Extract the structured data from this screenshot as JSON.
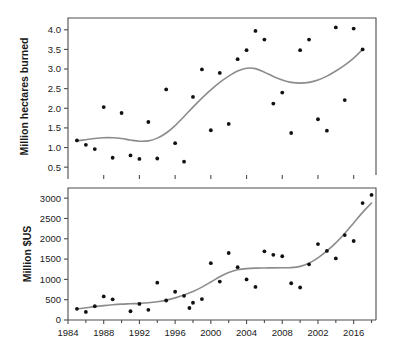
{
  "figure": {
    "type": "two-panel-scatter-with-smoother",
    "background": "#ffffff",
    "point_color": "#111111",
    "smoother_color": "#8c8c8c"
  },
  "chart_data": [
    {
      "type": "scatter",
      "panel": "top",
      "title": "",
      "xlabel": "",
      "ylabel": "Million hectares burned",
      "xlim": [
        1984,
        2018.5
      ],
      "ylim": [
        0.3,
        4.3
      ],
      "grid": false,
      "legend": "none",
      "xticks": [
        1984,
        1988,
        1992,
        1996,
        2000,
        2004,
        2008,
        2012,
        2016
      ],
      "xticklabels": [
        "",
        "",
        "",
        "",
        "",
        "",
        "",
        "",
        ""
      ],
      "yticks": [
        0.5,
        1.0,
        1.5,
        2.0,
        2.5,
        3.0,
        3.5,
        4.0
      ],
      "yticklabels": [
        "0.5",
        "1.0",
        "1.5",
        "2.0",
        "2.5",
        "3.0",
        "3.5",
        "4.0"
      ],
      "x": [
        1985,
        1986,
        1987,
        1988,
        1989,
        1990,
        1991,
        1992,
        1993,
        1994,
        1995,
        1996,
        1997,
        1998,
        1999,
        2000,
        2001,
        2002,
        2003,
        2004,
        2005,
        2006,
        2007,
        2008,
        2009,
        2010,
        2011,
        2012,
        2013,
        2014,
        2015,
        2016,
        2017,
        2018
      ],
      "y": [
        1.18,
        1.07,
        0.96,
        2.03,
        0.74,
        1.88,
        0.8,
        0.71,
        1.65,
        0.72,
        2.48,
        1.11,
        0.64,
        2.29,
        2.99,
        1.44,
        2.9,
        1.6,
        3.25,
        3.48,
        3.97,
        3.75,
        2.12,
        2.4,
        1.37,
        3.48,
        3.75,
        1.72,
        1.43,
        4.06,
        2.21,
        4.03,
        3.5
      ],
      "series": [
        {
          "name": "Annual burned area",
          "points": [
            {
              "x": 1985,
              "y": 1.18
            },
            {
              "x": 1986,
              "y": 1.07
            },
            {
              "x": 1987,
              "y": 0.96
            },
            {
              "x": 1988,
              "y": 2.03
            },
            {
              "x": 1989,
              "y": 0.74
            },
            {
              "x": 1990,
              "y": 1.88
            },
            {
              "x": 1991,
              "y": 0.8
            },
            {
              "x": 1992,
              "y": 0.71
            },
            {
              "x": 1993,
              "y": 1.65
            },
            {
              "x": 1994,
              "y": 0.72
            },
            {
              "x": 1995,
              "y": 2.48
            },
            {
              "x": 1996,
              "y": 1.11
            },
            {
              "x": 1997,
              "y": 0.64
            },
            {
              "x": 1998,
              "y": 2.29
            },
            {
              "x": 1999,
              "y": 2.99
            },
            {
              "x": 2000,
              "y": 1.44
            },
            {
              "x": 2001,
              "y": 2.9
            },
            {
              "x": 2002,
              "y": 1.6
            },
            {
              "x": 2003,
              "y": 3.25
            },
            {
              "x": 2004,
              "y": 3.48
            },
            {
              "x": 2005,
              "y": 3.97
            },
            {
              "x": 2006,
              "y": 3.75
            },
            {
              "x": 2007,
              "y": 2.12
            },
            {
              "x": 2008,
              "y": 2.4
            },
            {
              "x": 2009,
              "y": 1.37
            },
            {
              "x": 2010,
              "y": 3.48
            },
            {
              "x": 2011,
              "y": 3.75
            },
            {
              "x": 2012,
              "y": 1.72
            },
            {
              "x": 2013,
              "y": 1.43
            },
            {
              "x": 2014,
              "y": 4.06
            },
            {
              "x": 2015,
              "y": 2.21
            },
            {
              "x": 2016,
              "y": 4.03
            },
            {
              "x": 2017,
              "y": 3.5
            }
          ]
        }
      ],
      "smoother": {
        "name": "loess-trend",
        "points": [
          {
            "x": 1985,
            "y": 1.17
          },
          {
            "x": 1986,
            "y": 1.2
          },
          {
            "x": 1987,
            "y": 1.23
          },
          {
            "x": 1988,
            "y": 1.25
          },
          {
            "x": 1989,
            "y": 1.25
          },
          {
            "x": 1990,
            "y": 1.23
          },
          {
            "x": 1991,
            "y": 1.19
          },
          {
            "x": 1992,
            "y": 1.16
          },
          {
            "x": 1993,
            "y": 1.17
          },
          {
            "x": 1994,
            "y": 1.24
          },
          {
            "x": 1995,
            "y": 1.37
          },
          {
            "x": 1996,
            "y": 1.56
          },
          {
            "x": 1997,
            "y": 1.79
          },
          {
            "x": 1998,
            "y": 2.03
          },
          {
            "x": 1999,
            "y": 2.26
          },
          {
            "x": 2000,
            "y": 2.47
          },
          {
            "x": 2001,
            "y": 2.66
          },
          {
            "x": 2002,
            "y": 2.82
          },
          {
            "x": 2003,
            "y": 2.95
          },
          {
            "x": 2004,
            "y": 3.02
          },
          {
            "x": 2005,
            "y": 3.01
          },
          {
            "x": 2006,
            "y": 2.92
          },
          {
            "x": 2007,
            "y": 2.81
          },
          {
            "x": 2008,
            "y": 2.72
          },
          {
            "x": 2009,
            "y": 2.66
          },
          {
            "x": 2010,
            "y": 2.64
          },
          {
            "x": 2011,
            "y": 2.66
          },
          {
            "x": 2012,
            "y": 2.72
          },
          {
            "x": 2013,
            "y": 2.82
          },
          {
            "x": 2014,
            "y": 2.95
          },
          {
            "x": 2015,
            "y": 3.1
          },
          {
            "x": 2016,
            "y": 3.28
          },
          {
            "x": 2017,
            "y": 3.5
          }
        ]
      }
    },
    {
      "type": "scatter",
      "panel": "bottom",
      "title": "",
      "xlabel": "",
      "ylabel": "Million $US",
      "xlim": [
        1984,
        2018.5
      ],
      "ylim": [
        0,
        3250
      ],
      "grid": false,
      "legend": "none",
      "xticks": [
        1984,
        1988,
        1992,
        1996,
        2000,
        2004,
        2008,
        2012,
        2016
      ],
      "xticklabels": [
        "1984",
        "1988",
        "1992",
        "1996",
        "2000",
        "2004",
        "2008",
        "2002",
        "2016"
      ],
      "yticks": [
        0,
        500,
        1000,
        1500,
        2000,
        2500,
        3000
      ],
      "yticklabels": [
        "0",
        "500",
        "1000",
        "1500",
        "2000",
        "2500",
        "3000"
      ],
      "x": [
        1985,
        1986,
        1987,
        1988,
        1989,
        1990,
        1991,
        1992,
        1993,
        1994,
        1995,
        1996,
        1997,
        1998,
        1999,
        2000,
        2001,
        2002,
        2003,
        2004,
        2005,
        2006,
        2007,
        2008,
        2009,
        2010,
        2011,
        2012,
        2013,
        2014,
        2015,
        2016,
        2017,
        2018
      ],
      "y": [
        275,
        200,
        340,
        580,
        510,
        215,
        395,
        250,
        920,
        480,
        695,
        595,
        295,
        425,
        515,
        1400,
        945,
        1650,
        1300,
        1000,
        815,
        1690,
        1605,
        1570,
        905,
        800,
        1370,
        1870,
        1700,
        1515,
        2090,
        1945,
        2880,
        3080
      ],
      "series": [
        {
          "name": "Annual suppression cost",
          "points": [
            {
              "x": 1985,
              "y": 275
            },
            {
              "x": 1986,
              "y": 200
            },
            {
              "x": 1987,
              "y": 340
            },
            {
              "x": 1988,
              "y": 580
            },
            {
              "x": 1989,
              "y": 510
            },
            {
              "x": 1991,
              "y": 215
            },
            {
              "x": 1992,
              "y": 395
            },
            {
              "x": 1993,
              "y": 250
            },
            {
              "x": 1994,
              "y": 920
            },
            {
              "x": 1995,
              "y": 480
            },
            {
              "x": 1996,
              "y": 695
            },
            {
              "x": 1997,
              "y": 595
            },
            {
              "x": 1997.6,
              "y": 295
            },
            {
              "x": 1998,
              "y": 425
            },
            {
              "x": 1999,
              "y": 515
            },
            {
              "x": 2000,
              "y": 1400
            },
            {
              "x": 2001,
              "y": 945
            },
            {
              "x": 2002,
              "y": 1650
            },
            {
              "x": 2003,
              "y": 1300
            },
            {
              "x": 2004,
              "y": 1000
            },
            {
              "x": 2005,
              "y": 815
            },
            {
              "x": 2006,
              "y": 1690
            },
            {
              "x": 2007,
              "y": 1605
            },
            {
              "x": 2008,
              "y": 1570
            },
            {
              "x": 2009,
              "y": 905
            },
            {
              "x": 2010,
              "y": 800
            },
            {
              "x": 2011,
              "y": 1370
            },
            {
              "x": 2012,
              "y": 1870
            },
            {
              "x": 2013,
              "y": 1700
            },
            {
              "x": 2014,
              "y": 1515
            },
            {
              "x": 2015,
              "y": 2090
            },
            {
              "x": 2016,
              "y": 1945
            },
            {
              "x": 2017,
              "y": 2880
            },
            {
              "x": 2018,
              "y": 3080
            }
          ]
        }
      ],
      "smoother": {
        "name": "loess-trend",
        "points": [
          {
            "x": 1985,
            "y": 270
          },
          {
            "x": 1986,
            "y": 300
          },
          {
            "x": 1987,
            "y": 330
          },
          {
            "x": 1988,
            "y": 355
          },
          {
            "x": 1989,
            "y": 375
          },
          {
            "x": 1990,
            "y": 390
          },
          {
            "x": 1991,
            "y": 400
          },
          {
            "x": 1992,
            "y": 410
          },
          {
            "x": 1993,
            "y": 425
          },
          {
            "x": 1994,
            "y": 450
          },
          {
            "x": 1995,
            "y": 490
          },
          {
            "x": 1996,
            "y": 545
          },
          {
            "x": 1997,
            "y": 615
          },
          {
            "x": 1998,
            "y": 700
          },
          {
            "x": 1999,
            "y": 810
          },
          {
            "x": 2000,
            "y": 935
          },
          {
            "x": 2001,
            "y": 1065
          },
          {
            "x": 2002,
            "y": 1170
          },
          {
            "x": 2003,
            "y": 1235
          },
          {
            "x": 2004,
            "y": 1265
          },
          {
            "x": 2005,
            "y": 1278
          },
          {
            "x": 2006,
            "y": 1282
          },
          {
            "x": 2007,
            "y": 1284
          },
          {
            "x": 2008,
            "y": 1285
          },
          {
            "x": 2009,
            "y": 1290
          },
          {
            "x": 2010,
            "y": 1320
          },
          {
            "x": 2011,
            "y": 1400
          },
          {
            "x": 2012,
            "y": 1530
          },
          {
            "x": 2013,
            "y": 1700
          },
          {
            "x": 2014,
            "y": 1900
          },
          {
            "x": 2015,
            "y": 2130
          },
          {
            "x": 2016,
            "y": 2390
          },
          {
            "x": 2017,
            "y": 2650
          },
          {
            "x": 2018,
            "y": 2880
          }
        ]
      }
    }
  ]
}
